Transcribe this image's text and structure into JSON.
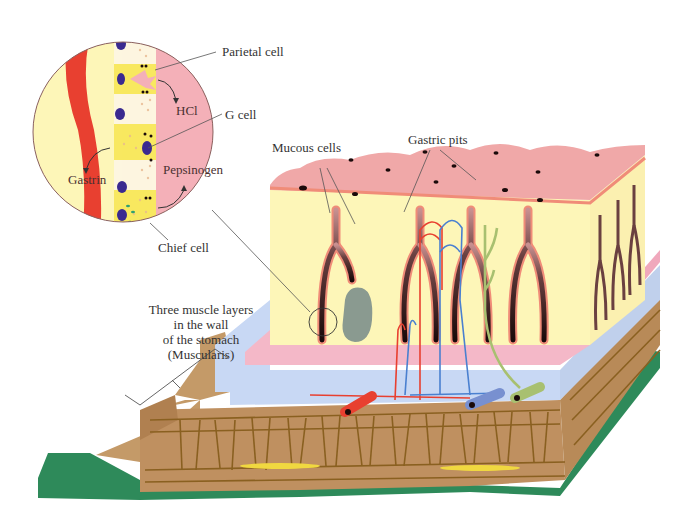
{
  "diagram": {
    "labels": {
      "parietal_cell": "Parietal cell",
      "hcl": "HCl",
      "g_cell": "G cell",
      "gastrin": "Gastrin",
      "pepsinogen": "Pepsinogen",
      "chief_cell": "Chief cell",
      "mucous_cells": "Mucous cells",
      "gastric_pits": "Gastric pits",
      "muscularis_line1": "Three muscle layers",
      "muscularis_line2": "in the wall",
      "muscularis_line3": "of the stomach",
      "muscularis_line4": "(Muscularis)"
    },
    "colors": {
      "mucosa_surface": "#f0a8a8",
      "gland_tissue": "#fdf6b8",
      "gland_lumen": "#2a1a1a",
      "gland_lining": "#f08c78",
      "submucosa": "#c8d8f4",
      "muscularis_mucosae": "#f4b8c8",
      "muscle_layer": "#bf9060",
      "muscle_lines": "#8a6020",
      "serosa": "#2e8a5a",
      "artery": "#e84030",
      "vein": "#7890d0",
      "nerve": "#a8c070",
      "lymph_nodule": "#8a9a90",
      "inset_blood_vessel": "#e84030",
      "inset_lumen": "#f4b0b8",
      "inset_nuclei": "#3a2a90",
      "chief_granules": "#30a070"
    }
  }
}
